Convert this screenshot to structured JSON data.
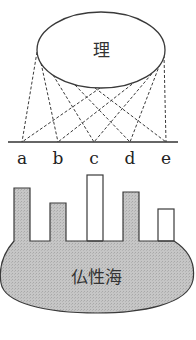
{
  "diagram": {
    "top_label": "理",
    "bottom_label": "仏性海",
    "points": [
      "a",
      "b",
      "c",
      "d",
      "e"
    ],
    "colors": {
      "stroke": "#3a3a3a",
      "shaded_fill": "#c4c4c4",
      "white_fill": "#ffffff"
    },
    "bars": [
      {
        "label": "a",
        "shaded": true
      },
      {
        "label": "b",
        "shaded": true
      },
      {
        "label": "c",
        "shaded": false
      },
      {
        "label": "d",
        "shaded": true
      },
      {
        "label": "e",
        "shaded": false
      }
    ]
  }
}
